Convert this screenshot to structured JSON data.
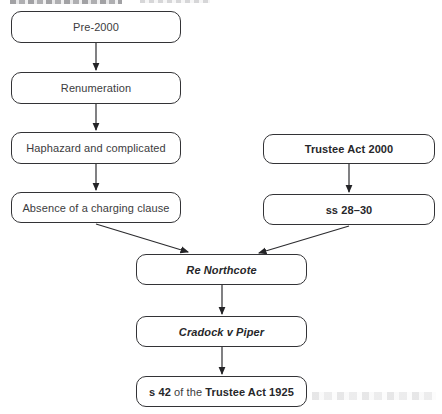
{
  "diagram": {
    "type": "flowchart",
    "colors": {
      "background": "#ffffff",
      "node_border": "#333336",
      "regular_text": "#3c3c40",
      "bold_text": "#27272a",
      "arrow": "#242427"
    },
    "nodes": [
      {
        "id": "pre2000",
        "label": "Pre-2000",
        "style": "regular"
      },
      {
        "id": "renumeration",
        "label": "Renumeration",
        "style": "regular"
      },
      {
        "id": "haphazard",
        "label": "Haphazard and complicated",
        "style": "regular"
      },
      {
        "id": "absence",
        "label": "Absence of a charging clause",
        "style": "regular"
      },
      {
        "id": "trustee-act-2000",
        "label": "Trustee Act 2000",
        "style": "bold"
      },
      {
        "id": "ss-28-30",
        "label": "ss 28–30",
        "style": "bold"
      },
      {
        "id": "re-northcote",
        "label": "Re Northcote",
        "style": "bold-italic"
      },
      {
        "id": "cradock-v-piper",
        "label": "Cradock v Piper",
        "style": "bold-italic"
      },
      {
        "id": "s42-trustee-act-1925",
        "parts": {
          "0": "s 42",
          "1": " of the ",
          "2": "Trustee Act 1925"
        },
        "style": "mixed"
      }
    ],
    "edges": [
      {
        "from": "pre2000",
        "to": "renumeration"
      },
      {
        "from": "renumeration",
        "to": "haphazard"
      },
      {
        "from": "haphazard",
        "to": "absence"
      },
      {
        "from": "trustee-act-2000",
        "to": "ss-28-30"
      },
      {
        "from": "absence",
        "to": "re-northcote"
      },
      {
        "from": "ss-28-30",
        "to": "re-northcote"
      },
      {
        "from": "re-northcote",
        "to": "cradock-v-piper"
      },
      {
        "from": "cradock-v-piper",
        "to": "s42-trustee-act-1925"
      }
    ]
  }
}
